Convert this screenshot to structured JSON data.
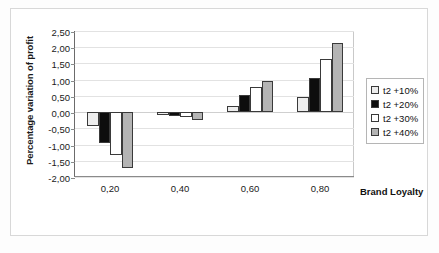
{
  "chart_data": {
    "type": "bar",
    "title": "",
    "xlabel": "Brand Loyalty",
    "ylabel": "Percentage variation of profit",
    "categories": [
      "0,20",
      "0,40",
      "0,60",
      "0,80"
    ],
    "ylim": [
      -2.0,
      2.5
    ],
    "ytick_labels": [
      "2,50",
      "2,00",
      "1,50",
      "1,00",
      "0,50",
      "0,00",
      "-0,50",
      "-1,00",
      "-1,50",
      "-2,00"
    ],
    "ytick_values": [
      2.5,
      2.0,
      1.5,
      1.0,
      0.5,
      0.0,
      -0.5,
      -1.0,
      -1.5,
      -2.0
    ],
    "grid": true,
    "legend_position": "right",
    "series": [
      {
        "name": "t2 +10%",
        "color": "#ededed",
        "values": [
          -0.42,
          -0.08,
          0.2,
          0.48
        ]
      },
      {
        "name": "t2 +20%",
        "color": "#0d0d0d",
        "values": [
          -0.95,
          -0.12,
          0.52,
          1.05
        ]
      },
      {
        "name": "t2 +30%",
        "color": "#ffffff",
        "values": [
          -1.33,
          -0.15,
          0.78,
          1.65
        ]
      },
      {
        "name": "t2 +40%",
        "color": "#b4b4b4",
        "values": [
          -1.72,
          -0.25,
          0.97,
          2.12
        ]
      }
    ]
  },
  "legend": {
    "items": [
      {
        "label": "t2 +10%",
        "color": "#ededed"
      },
      {
        "label": "t2 +20%",
        "color": "#0d0d0d"
      },
      {
        "label": "t2 +30%",
        "color": "#ffffff"
      },
      {
        "label": "t2 +40%",
        "color": "#b4b4b4"
      }
    ]
  },
  "axes": {
    "y_title": "Percentage variation of profit",
    "x_title": "Brand Loyalty"
  }
}
